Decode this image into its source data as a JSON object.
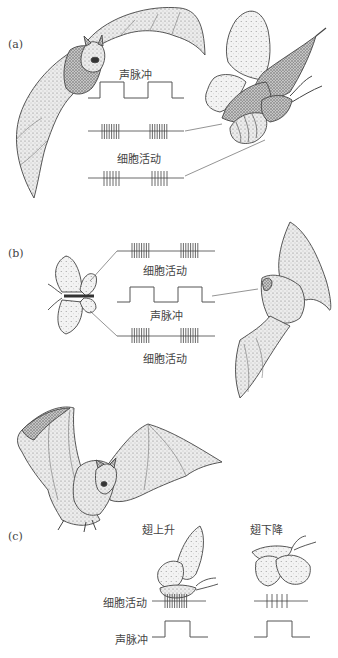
{
  "figure": {
    "panels": [
      {
        "id": "a",
        "label": "(a)",
        "sound_pulse_label": "声脉冲",
        "cell_activity_label": "细胞活动",
        "traces": [
          {
            "name": "sound-pulse",
            "type": "square-wave",
            "pulses": 2
          },
          {
            "name": "cell-activity-1",
            "type": "spike-train",
            "bursts": [
              8,
              8
            ]
          },
          {
            "name": "cell-activity-2",
            "type": "spike-train",
            "bursts": [
              6,
              6
            ]
          }
        ]
      },
      {
        "id": "b",
        "label": "(b)",
        "cell_activity_top_label": "细胞活动",
        "sound_pulse_label": "声脉冲",
        "cell_activity_bottom_label": "细胞活动",
        "traces": [
          {
            "name": "cell-activity-top",
            "type": "spike-train",
            "bursts": [
              8,
              8
            ]
          },
          {
            "name": "sound-pulse",
            "type": "square-wave",
            "pulses": 2
          },
          {
            "name": "cell-activity-bottom",
            "type": "spike-train",
            "bursts": [
              8,
              8
            ]
          }
        ]
      },
      {
        "id": "c",
        "label": "(c)",
        "wing_up_label": "翅上升",
        "wing_down_label": "翅下降",
        "cell_activity_label": "细胞活动",
        "sound_pulse_label": "声脉冲",
        "traces": [
          {
            "name": "cell-activity-wing-up",
            "type": "spike-train",
            "bursts": [
              9
            ]
          },
          {
            "name": "cell-activity-wing-down",
            "type": "spike-train",
            "bursts": [
              5
            ]
          },
          {
            "name": "sound-pulse-wing-up",
            "type": "square-wave",
            "pulses": 1
          },
          {
            "name": "sound-pulse-wing-down",
            "type": "square-wave",
            "pulses": 1
          }
        ]
      }
    ],
    "colors": {
      "ink": "#4a4a4a",
      "wing_fill": "#e4e4e4",
      "body_fill": "#b8b8b8",
      "dark_fill": "#8a8a8a",
      "line": "#555555"
    }
  }
}
